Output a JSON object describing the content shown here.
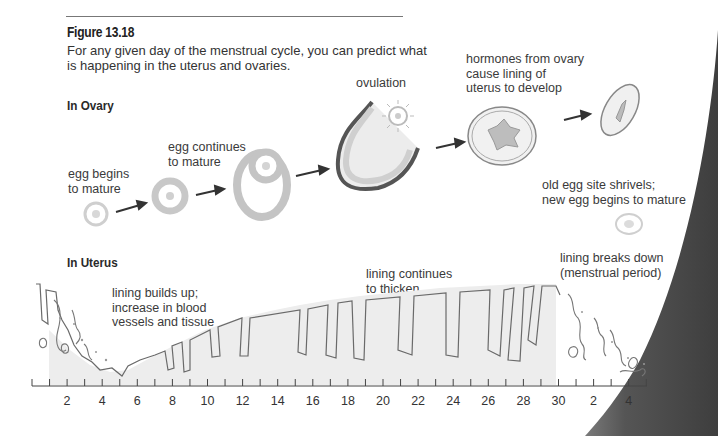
{
  "figure": {
    "title": "Figure 13.18",
    "caption": "For any given day of the menstrual cycle, you can predict what is happening in the uterus and ovaries."
  },
  "ovary": {
    "heading": "In Ovary",
    "stages": [
      {
        "id": "egg-begins",
        "label_line1": "egg begins",
        "label_line2": "to mature"
      },
      {
        "id": "egg-continues",
        "label_line1": "egg continues",
        "label_line2": "to mature"
      },
      {
        "id": "ovulation",
        "label_line1": "ovulation",
        "label_line2": ""
      },
      {
        "id": "hormones",
        "label_line1": "hormones from ovary",
        "label_line2": "cause lining of",
        "label_line3": "uterus to develop"
      },
      {
        "id": "old-egg-site",
        "label_line1": "old egg site shrivels;",
        "label_line2": "new egg begins to mature"
      }
    ]
  },
  "uterus": {
    "heading": "In Uterus",
    "annotations": [
      {
        "id": "builds-up",
        "line1": "lining builds up;",
        "line2": "increase in blood",
        "line3": "vessels and tissue"
      },
      {
        "id": "continues",
        "line1": "lining continues",
        "line2": "to thicken"
      },
      {
        "id": "breaks-down",
        "line1": "lining breaks down",
        "line2": "(menstrual period)"
      }
    ]
  },
  "axis": {
    "tick_labels": [
      "2",
      "4",
      "6",
      "8",
      "10",
      "12",
      "14",
      "16",
      "18",
      "20",
      "22",
      "24",
      "26",
      "28",
      "30",
      "2",
      "4"
    ]
  },
  "colors": {
    "lining_fill": "#ededed",
    "outline": "#6a6a6a",
    "egg_gray": "#c8c8c8",
    "arrow": "#333333",
    "page_shadow": "#4a4a4a"
  }
}
